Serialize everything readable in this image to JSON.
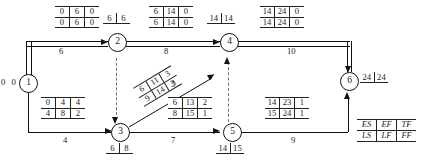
{
  "diagram": {
    "nodes": [
      {
        "id": "1",
        "label": "1",
        "value_left": "0 0"
      },
      {
        "id": "2",
        "label": "2",
        "early": "6",
        "late": "6"
      },
      {
        "id": "3",
        "label": "3",
        "early": "6",
        "late": "8"
      },
      {
        "id": "4",
        "label": "4",
        "early": "14",
        "late": "14"
      },
      {
        "id": "5",
        "label": "5",
        "early": "14",
        "late": "15"
      },
      {
        "id": "6",
        "label": "6",
        "early": "24",
        "late": "24"
      }
    ],
    "activities": [
      {
        "name": "activity-1-2",
        "from": "1",
        "to": "2",
        "duration": "6",
        "critical": true,
        "es": "0",
        "ef": "6",
        "tf": "0",
        "ls": "0",
        "lf": "6",
        "ff": "0"
      },
      {
        "name": "activity-2-4",
        "from": "2",
        "to": "4",
        "duration": "8",
        "critical": true,
        "es": "6",
        "ef": "14",
        "tf": "0",
        "ls": "6",
        "lf": "14",
        "ff": "0"
      },
      {
        "name": "activity-4-6",
        "from": "4",
        "to": "6",
        "duration": "10",
        "critical": true,
        "es": "14",
        "ef": "24",
        "tf": "0",
        "ls": "14",
        "lf": "24",
        "ff": "0"
      },
      {
        "name": "activity-1-3",
        "from": "1",
        "to": "3",
        "duration": "4",
        "critical": false,
        "es": "0",
        "ef": "4",
        "tf": "4",
        "ls": "4",
        "lf": "8",
        "ff": "2"
      },
      {
        "name": "activity-3-4",
        "from": "3",
        "to": "4",
        "duration": "5",
        "critical": false,
        "es": "6",
        "ef": "11",
        "tf": "3",
        "ls": "9",
        "lf": "14",
        "ff": "3"
      },
      {
        "name": "activity-3-5",
        "from": "3",
        "to": "5",
        "duration": "7",
        "critical": false,
        "es": "6",
        "ef": "13",
        "tf": "2",
        "ls": "8",
        "lf": "15",
        "ff": "1"
      },
      {
        "name": "activity-5-6",
        "from": "5",
        "to": "6",
        "duration": "9",
        "critical": false,
        "es": "14",
        "ef": "23",
        "tf": "1",
        "ls": "15",
        "lf": "24",
        "ff": "1"
      }
    ],
    "dummies": [
      {
        "name": "dummy-2-3",
        "from": "2",
        "to": "3"
      },
      {
        "name": "dummy-5-4",
        "from": "5",
        "to": "4"
      }
    ],
    "legend": {
      "es": "ES",
      "ef": "EF",
      "tf": "TF",
      "ls": "LS",
      "lf": "LF",
      "ff": "FF"
    }
  }
}
